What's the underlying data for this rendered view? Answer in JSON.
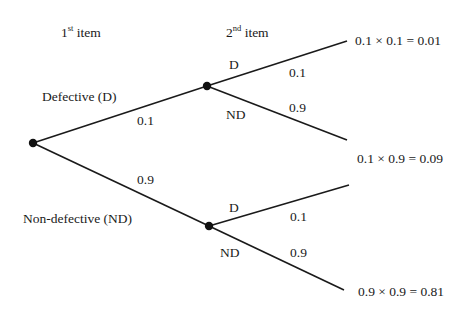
{
  "headers": {
    "first": {
      "num": "1",
      "sup": "st",
      "text": " item"
    },
    "second": {
      "num": "2",
      "sup": "nd",
      "text": " item"
    }
  },
  "first_branches": {
    "defective": {
      "label": "Defective (D)",
      "prob": "0.1"
    },
    "non_defective": {
      "label": "Non-defective (ND)",
      "prob": "0.9"
    }
  },
  "second_branches": {
    "after_d": {
      "d_label": "D",
      "d_prob": "0.1",
      "nd_label": "ND",
      "nd_prob": "0.9"
    },
    "after_nd": {
      "d_label": "D",
      "d_prob": "0.1",
      "nd_label": "ND",
      "nd_prob": "0.9"
    }
  },
  "outcomes": {
    "d_d": "0.1 × 0.1 = 0.01",
    "d_nd": "0.1 × 0.9 = 0.09",
    "nd_nd": "0.9 × 0.9 = 0.81"
  },
  "colors": {
    "line": "#1a1a1a",
    "node": "#111111",
    "background": "#ffffff"
  }
}
